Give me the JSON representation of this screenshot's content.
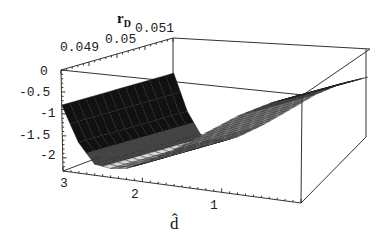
{
  "chart_data": {
    "type": "surface3d",
    "title": "",
    "zlabel": "r",
    "zlabel_sub": "D",
    "xlabel": "d̂",
    "ylabel": "",
    "x_axis": {
      "name": "d-hat",
      "range": [
        0,
        3
      ],
      "ticks": [
        "3",
        "2",
        "1"
      ]
    },
    "y_axis": {
      "name": "parameter",
      "range": [
        0.048,
        0.052
      ],
      "ticks": [
        "0.049",
        "0.05",
        "0.051"
      ]
    },
    "z_axis": {
      "name": "r_D",
      "range": [
        -2.3,
        0
      ],
      "ticks": [
        "0",
        "-0.5",
        "-1",
        "-1.5",
        "-2"
      ]
    },
    "surface_description": "Surface rises from about -0.8 at d=3 down to a minimum near -2.1 around d≈2.5, then increases smoothly to about 0 at d=0; nearly constant along the parameter axis.",
    "sample_profile": {
      "d": [
        3.0,
        2.8,
        2.6,
        2.4,
        2.2,
        2.0,
        1.6,
        1.2,
        0.8,
        0.4,
        0.0
      ],
      "r_D": [
        -0.8,
        -1.6,
        -2.05,
        -2.1,
        -2.05,
        -1.9,
        -1.5,
        -1.05,
        -0.6,
        -0.25,
        0.0
      ]
    },
    "grid": false,
    "box": true
  },
  "labels": {
    "z_ticks": [
      "0",
      "-0.5",
      "-1",
      "-1.5",
      "-2"
    ],
    "y_ticks": [
      "0.049",
      "0.05",
      "0.051"
    ],
    "x_ticks": [
      "3",
      "2",
      "1"
    ],
    "zlabel": "r",
    "zlabel_sub": "D",
    "xlabel": "d̂"
  }
}
